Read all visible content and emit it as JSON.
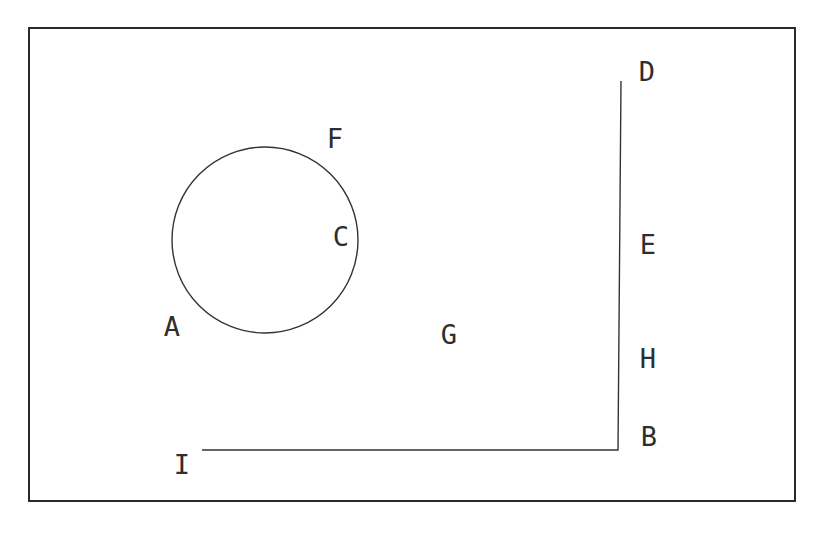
{
  "diagram": {
    "type": "geometry-figure",
    "colors": {
      "background": "#ffffff",
      "stroke": "#333333",
      "frame": "#2a2a2a"
    },
    "frame": {
      "x1": 28,
      "y1": 28,
      "x2": 795,
      "y2": 501
    },
    "circle": {
      "cx": 265,
      "cy": 240,
      "r": 93
    },
    "polyline": {
      "points": [
        [
          621,
          81
        ],
        [
          618,
          450
        ],
        [
          202,
          450
        ]
      ]
    },
    "labels": {
      "A": {
        "text": "A",
        "x": 172,
        "y": 328
      },
      "B": {
        "text": "B",
        "x": 649,
        "y": 438
      },
      "C": {
        "text": "C",
        "x": 341,
        "y": 238
      },
      "D": {
        "text": "D",
        "x": 647,
        "y": 73
      },
      "E": {
        "text": "E",
        "x": 648,
        "y": 246
      },
      "F": {
        "text": "F",
        "x": 335,
        "y": 140
      },
      "G": {
        "text": "G",
        "x": 449,
        "y": 336
      },
      "H": {
        "text": "H",
        "x": 648,
        "y": 360
      },
      "I": {
        "text": "I",
        "x": 182,
        "y": 466
      }
    }
  }
}
